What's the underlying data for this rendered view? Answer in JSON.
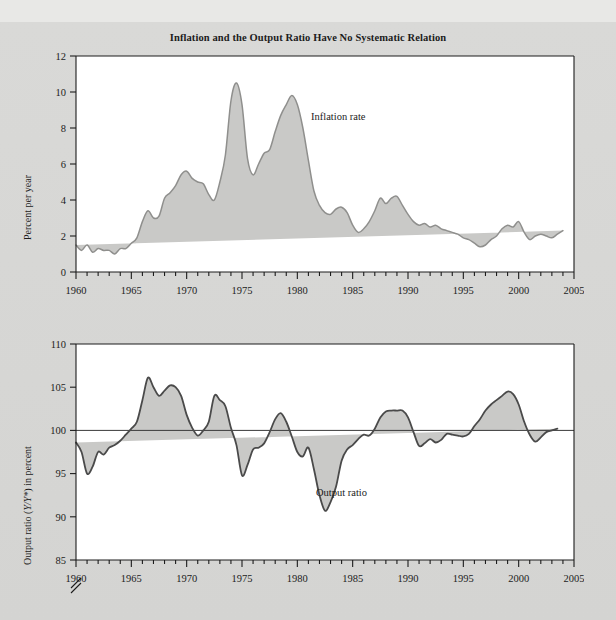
{
  "figure": {
    "title": "Inflation and the Output Ratio Have No Systematic Relation",
    "background_color": "#d6d6d4",
    "plot_background_color": "#ffffff",
    "fill_color": "#c9c9c7",
    "line_color": "#8f8f8d",
    "axis_color": "#1c1c1c"
  },
  "top_ylabel": "Percent per year",
  "bottom_ylabel_pre": "Output ratio (",
  "bottom_ylabel_italic": "Y/Y*",
  "bottom_ylabel_post": ") in percent",
  "chart_data": [
    {
      "type": "area",
      "title": "Inflation and the Output Ratio Have No Systematic Relation",
      "series_name": "Inflation rate",
      "annotation": "Inflation rate",
      "xlabel": "",
      "ylabel": "Percent per year",
      "xlim": [
        1960,
        2005
      ],
      "ylim": [
        0,
        12
      ],
      "yticks": [
        0,
        2,
        4,
        6,
        8,
        10,
        12
      ],
      "ytick_labels": [
        "0",
        "2",
        "4",
        "6",
        "8",
        "10",
        "12"
      ],
      "xticks": [
        1960,
        1965,
        1970,
        1975,
        1980,
        1985,
        1990,
        1995,
        2000,
        2005
      ],
      "xtick_labels": [
        "1960",
        "1965",
        "1970",
        "1975",
        "1980",
        "1985",
        "1990",
        "1995",
        "2000",
        "2005"
      ],
      "minor_xtick_step": 1,
      "grid": false,
      "legend": "annotation-inline",
      "x": [
        1960.0,
        1960.5,
        1961.0,
        1961.5,
        1962.0,
        1962.5,
        1963.0,
        1963.5,
        1964.0,
        1964.5,
        1965.0,
        1965.5,
        1966.0,
        1966.5,
        1967.0,
        1967.5,
        1968.0,
        1968.5,
        1969.0,
        1969.5,
        1970.0,
        1970.5,
        1971.0,
        1971.5,
        1972.0,
        1972.5,
        1973.0,
        1973.5,
        1974.0,
        1974.5,
        1975.0,
        1975.5,
        1976.0,
        1976.5,
        1977.0,
        1977.5,
        1978.0,
        1978.5,
        1979.0,
        1979.5,
        1980.0,
        1980.5,
        1981.0,
        1981.5,
        1982.0,
        1982.5,
        1983.0,
        1983.5,
        1984.0,
        1984.5,
        1985.0,
        1985.5,
        1986.0,
        1986.5,
        1987.0,
        1987.5,
        1988.0,
        1988.5,
        1989.0,
        1989.5,
        1990.0,
        1990.5,
        1991.0,
        1991.5,
        1992.0,
        1992.5,
        1993.0,
        1993.5,
        1994.0,
        1994.5,
        1995.0,
        1995.5,
        1996.0,
        1996.5,
        1997.0,
        1997.5,
        1998.0,
        1998.5,
        1999.0,
        1999.5,
        2000.0,
        2000.5,
        2001.0,
        2001.5,
        2002.0,
        2002.5,
        2003.0,
        2003.5,
        2004.0,
        2004.5,
        2005.0
      ],
      "values": [
        1.5,
        1.2,
        1.5,
        1.1,
        1.3,
        1.2,
        1.2,
        1.0,
        1.3,
        1.3,
        1.6,
        1.9,
        2.8,
        3.4,
        3.0,
        3.1,
        4.1,
        4.4,
        4.8,
        5.4,
        5.6,
        5.2,
        5.0,
        4.9,
        4.3,
        4.0,
        5.0,
        6.5,
        9.5,
        10.5,
        9.3,
        6.3,
        5.4,
        6.0,
        6.6,
        6.8,
        7.8,
        8.7,
        9.3,
        9.8,
        9.3,
        8.0,
        6.2,
        4.5,
        3.7,
        3.3,
        3.2,
        3.5,
        3.6,
        3.3,
        2.6,
        2.2,
        2.4,
        2.8,
        3.4,
        4.1,
        3.8,
        4.1,
        4.2,
        3.7,
        3.2,
        2.8,
        2.6,
        2.7,
        2.5,
        2.6,
        2.4,
        2.3,
        2.2,
        2.1,
        1.9,
        1.8,
        1.6,
        1.4,
        1.5,
        1.8,
        2.0,
        2.4,
        2.6,
        2.5,
        2.8,
        2.2,
        1.8,
        2.0,
        2.1,
        2.0,
        1.9,
        2.1,
        2.3,
        2.5
      ],
      "peaks": [
        {
          "year": 1974.8,
          "value": 10.5
        },
        {
          "year": 1980.8,
          "value": 9.8
        },
        {
          "year": 1970.0,
          "value": 5.6
        },
        {
          "year": 1989.8,
          "value": 4.2
        }
      ],
      "troughs": [
        {
          "year": 1963.5,
          "value": 1.0
        },
        {
          "year": 1998.0,
          "value": 1.4
        }
      ]
    },
    {
      "type": "area",
      "series_name": "Output ratio",
      "annotation": "Output ratio",
      "xlabel": "",
      "ylabel": "Output ratio (Y/Y*) in percent",
      "xlim": [
        1960,
        2005
      ],
      "ylim": [
        85,
        110
      ],
      "yticks": [
        85,
        90,
        95,
        100,
        105,
        110
      ],
      "ytick_labels": [
        "85",
        "90",
        "95",
        "100",
        "105",
        "110"
      ],
      "xticks": [
        1960,
        1965,
        1970,
        1975,
        1980,
        1985,
        1990,
        1995,
        2000,
        2005
      ],
      "xtick_labels": [
        "1960",
        "1965",
        "1970",
        "1975",
        "1980",
        "1985",
        "1990",
        "1995",
        "2000",
        "2005"
      ],
      "minor_xtick_step": 1,
      "axis_break_below": 85,
      "baseline": 100,
      "grid": false,
      "legend": "annotation-inline",
      "x": [
        1960.0,
        1960.5,
        1961.0,
        1961.5,
        1962.0,
        1962.5,
        1963.0,
        1963.5,
        1964.0,
        1964.5,
        1965.0,
        1965.5,
        1966.0,
        1966.5,
        1967.0,
        1967.5,
        1968.0,
        1968.5,
        1969.0,
        1969.5,
        1970.0,
        1970.5,
        1971.0,
        1971.5,
        1972.0,
        1972.5,
        1973.0,
        1973.5,
        1974.0,
        1974.5,
        1975.0,
        1975.5,
        1976.0,
        1976.5,
        1977.0,
        1977.5,
        1978.0,
        1978.5,
        1979.0,
        1979.5,
        1980.0,
        1980.5,
        1981.0,
        1981.5,
        1982.0,
        1982.5,
        1983.0,
        1983.5,
        1984.0,
        1984.5,
        1985.0,
        1985.5,
        1986.0,
        1986.5,
        1987.0,
        1987.5,
        1988.0,
        1988.5,
        1989.0,
        1989.5,
        1990.0,
        1990.5,
        1991.0,
        1991.5,
        1992.0,
        1992.5,
        1993.0,
        1993.5,
        1994.0,
        1994.5,
        1995.0,
        1995.5,
        1996.0,
        1996.5,
        1997.0,
        1997.5,
        1998.0,
        1998.5,
        1999.0,
        1999.5,
        2000.0,
        2000.5,
        2001.0,
        2001.5,
        2002.0,
        2002.5,
        2003.0,
        2003.5,
        2004.0,
        2004.5,
        2005.0
      ],
      "values": [
        98.6,
        97.5,
        95.0,
        95.8,
        97.5,
        97.2,
        98.0,
        98.3,
        98.8,
        99.5,
        100.2,
        101.0,
        103.5,
        106.1,
        105.0,
        104.0,
        104.6,
        105.2,
        105.0,
        104.0,
        101.8,
        100.3,
        99.4,
        100.0,
        101.0,
        104.0,
        103.5,
        102.8,
        100.3,
        98.3,
        94.8,
        96.0,
        97.8,
        98.0,
        98.5,
        99.8,
        101.3,
        102.0,
        101.0,
        99.3,
        97.5,
        97.0,
        98.0,
        95.5,
        92.5,
        90.7,
        91.7,
        93.5,
        96.5,
        97.8,
        98.3,
        99.0,
        99.5,
        99.4,
        100.2,
        101.5,
        102.2,
        102.3,
        102.3,
        102.3,
        101.5,
        99.8,
        98.2,
        98.5,
        99.0,
        98.6,
        98.9,
        99.6,
        99.5,
        99.4,
        99.3,
        99.6,
        100.5,
        101.3,
        102.3,
        103.0,
        103.5,
        104.0,
        104.5,
        104.2,
        103.0,
        101.0,
        99.5,
        98.7,
        99.2,
        99.8,
        100.0,
        100.2,
        100.3
      ],
      "peaks": [
        {
          "year": 1966.4,
          "value": 106.1
        },
        {
          "year": 1968.5,
          "value": 105.2
        },
        {
          "year": 1973.0,
          "value": 104.0
        },
        {
          "year": 1978.5,
          "value": 102.0
        },
        {
          "year": 1989.0,
          "value": 102.3
        },
        {
          "year": 2000.0,
          "value": 104.5
        }
      ],
      "troughs": [
        {
          "year": 1961.0,
          "value": 95.0
        },
        {
          "year": 1975.0,
          "value": 94.8
        },
        {
          "year": 1982.5,
          "value": 90.7
        },
        {
          "year": 1991.0,
          "value": 98.2
        },
        {
          "year": 2002.0,
          "value": 98.7
        }
      ]
    }
  ]
}
